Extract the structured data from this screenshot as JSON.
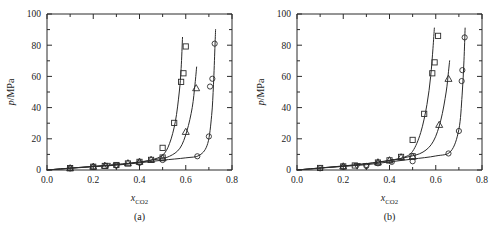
{
  "figure": {
    "panels": [
      {
        "id": "a",
        "caption": "(a)",
        "xlabel_main": "x",
        "xlabel_sub": "CO2",
        "ylabel_main": "p",
        "ylabel_rest": "/MPa"
      },
      {
        "id": "b",
        "caption": "(b)",
        "xlabel_main": "x",
        "xlabel_sub": "CO2",
        "ylabel_main": "p",
        "ylabel_rest": "/MPa"
      }
    ],
    "xticklabels": [
      "0.0",
      "0.2",
      "0.4",
      "0.6",
      "0.8"
    ],
    "yticklabels": [
      "0",
      "20",
      "40",
      "60",
      "80",
      "100"
    ],
    "colors": {
      "axis": "#2b2b2b",
      "curve": "#2b2b2b",
      "marker": "#2b2b2b",
      "background": "#ffffff"
    }
  },
  "chart_data": [
    {
      "type": "scatter",
      "panel": "(a)",
      "title": "",
      "xlabel": "x_CO2",
      "ylabel": "p/MPa",
      "xlim": [
        0.0,
        0.8
      ],
      "ylim": [
        0,
        100
      ],
      "xticks": [
        0.0,
        0.2,
        0.4,
        0.6,
        0.8
      ],
      "yticks": [
        0,
        20,
        40,
        60,
        80,
        100
      ],
      "xminorticks": [
        0.1,
        0.3,
        0.5,
        0.7
      ],
      "yminorticks": [
        10,
        30,
        50,
        70,
        90
      ],
      "grid": false,
      "legend": "none",
      "series": [
        {
          "name": "isotherm-1-square",
          "marker": "square",
          "points": [
            {
              "x": 0.1,
              "y": 1.2
            },
            {
              "x": 0.2,
              "y": 2.1
            },
            {
              "x": 0.25,
              "y": 2.6
            },
            {
              "x": 0.3,
              "y": 3.2
            },
            {
              "x": 0.35,
              "y": 4.2
            },
            {
              "x": 0.4,
              "y": 5.2
            },
            {
              "x": 0.45,
              "y": 6.5
            },
            {
              "x": 0.5,
              "y": 8.0
            },
            {
              "x": 0.5,
              "y": 14.2
            },
            {
              "x": 0.55,
              "y": 30.2
            },
            {
              "x": 0.58,
              "y": 56.5
            },
            {
              "x": 0.59,
              "y": 62.0
            },
            {
              "x": 0.6,
              "y": 79.2
            }
          ],
          "curve": [
            {
              "x": 0.0,
              "y": 0.0
            },
            {
              "x": 0.1,
              "y": 1.2
            },
            {
              "x": 0.2,
              "y": 2.3
            },
            {
              "x": 0.3,
              "y": 3.4
            },
            {
              "x": 0.4,
              "y": 5.0
            },
            {
              "x": 0.45,
              "y": 6.4
            },
            {
              "x": 0.5,
              "y": 9.5
            },
            {
              "x": 0.53,
              "y": 17.0
            },
            {
              "x": 0.555,
              "y": 31.0
            },
            {
              "x": 0.572,
              "y": 50.0
            },
            {
              "x": 0.58,
              "y": 65.0
            },
            {
              "x": 0.586,
              "y": 85.0
            }
          ]
        },
        {
          "name": "isotherm-2-triangle",
          "marker": "triangle-up",
          "points": [
            {
              "x": 0.1,
              "y": 1.2
            },
            {
              "x": 0.2,
              "y": 2.2
            },
            {
              "x": 0.25,
              "y": 2.8
            },
            {
              "x": 0.35,
              "y": 4.4
            },
            {
              "x": 0.4,
              "y": 5.4
            },
            {
              "x": 0.45,
              "y": 6.6
            },
            {
              "x": 0.5,
              "y": 7.6
            },
            {
              "x": 0.6,
              "y": 24.5
            },
            {
              "x": 0.645,
              "y": 52.5
            }
          ],
          "curve": [
            {
              "x": 0.0,
              "y": 0.0
            },
            {
              "x": 0.1,
              "y": 1.2
            },
            {
              "x": 0.2,
              "y": 2.3
            },
            {
              "x": 0.3,
              "y": 3.5
            },
            {
              "x": 0.4,
              "y": 5.2
            },
            {
              "x": 0.48,
              "y": 7.0
            },
            {
              "x": 0.53,
              "y": 8.8
            },
            {
              "x": 0.575,
              "y": 14.0
            },
            {
              "x": 0.605,
              "y": 25.0
            },
            {
              "x": 0.628,
              "y": 40.0
            },
            {
              "x": 0.64,
              "y": 55.0
            },
            {
              "x": 0.647,
              "y": 66.0
            }
          ]
        },
        {
          "name": "isotherm-3-circle",
          "marker": "circle",
          "points": [
            {
              "x": 0.1,
              "y": 1.0
            },
            {
              "x": 0.2,
              "y": 2.0
            },
            {
              "x": 0.3,
              "y": 2.9
            },
            {
              "x": 0.4,
              "y": 4.6
            },
            {
              "x": 0.5,
              "y": 6.4
            },
            {
              "x": 0.65,
              "y": 8.8
            },
            {
              "x": 0.7,
              "y": 21.5
            },
            {
              "x": 0.705,
              "y": 53.5
            },
            {
              "x": 0.715,
              "y": 58.5
            },
            {
              "x": 0.725,
              "y": 81.0
            }
          ],
          "curve": [
            {
              "x": 0.0,
              "y": 0.0
            },
            {
              "x": 0.1,
              "y": 1.1
            },
            {
              "x": 0.2,
              "y": 2.1
            },
            {
              "x": 0.3,
              "y": 3.1
            },
            {
              "x": 0.4,
              "y": 4.6
            },
            {
              "x": 0.5,
              "y": 6.3
            },
            {
              "x": 0.6,
              "y": 7.8
            },
            {
              "x": 0.66,
              "y": 9.5
            },
            {
              "x": 0.695,
              "y": 17.0
            },
            {
              "x": 0.712,
              "y": 35.0
            },
            {
              "x": 0.72,
              "y": 55.0
            },
            {
              "x": 0.726,
              "y": 78.0
            },
            {
              "x": 0.729,
              "y": 90.0
            }
          ]
        },
        {
          "name": "low-x-inverted-triangle",
          "marker": "triangle-down",
          "points": [
            {
              "x": 0.26,
              "y": 2.7
            },
            {
              "x": 0.3,
              "y": 2.8
            }
          ],
          "curve": []
        }
      ]
    },
    {
      "type": "scatter",
      "panel": "(b)",
      "title": "",
      "xlabel": "x_CO2",
      "ylabel": "p/MPa",
      "xlim": [
        0.0,
        0.8
      ],
      "ylim": [
        0,
        100
      ],
      "xticks": [
        0.0,
        0.2,
        0.4,
        0.6,
        0.8
      ],
      "yticks": [
        0,
        20,
        40,
        60,
        80,
        100
      ],
      "xminorticks": [
        0.1,
        0.3,
        0.5,
        0.7
      ],
      "yminorticks": [
        10,
        30,
        50,
        70,
        90
      ],
      "grid": false,
      "legend": "none",
      "series": [
        {
          "name": "isotherm-1-square",
          "marker": "square",
          "points": [
            {
              "x": 0.1,
              "y": 1.3
            },
            {
              "x": 0.2,
              "y": 2.3
            },
            {
              "x": 0.25,
              "y": 2.9
            },
            {
              "x": 0.35,
              "y": 4.8
            },
            {
              "x": 0.4,
              "y": 6.2
            },
            {
              "x": 0.45,
              "y": 8.4
            },
            {
              "x": 0.5,
              "y": 8.8
            },
            {
              "x": 0.5,
              "y": 19.3
            },
            {
              "x": 0.55,
              "y": 36.0
            },
            {
              "x": 0.585,
              "y": 62.0
            },
            {
              "x": 0.595,
              "y": 69.0
            },
            {
              "x": 0.61,
              "y": 86.0
            }
          ],
          "curve": [
            {
              "x": 0.0,
              "y": 0.0
            },
            {
              "x": 0.1,
              "y": 1.3
            },
            {
              "x": 0.2,
              "y": 2.5
            },
            {
              "x": 0.3,
              "y": 4.0
            },
            {
              "x": 0.4,
              "y": 6.0
            },
            {
              "x": 0.46,
              "y": 8.0
            },
            {
              "x": 0.5,
              "y": 12.0
            },
            {
              "x": 0.535,
              "y": 24.0
            },
            {
              "x": 0.562,
              "y": 42.0
            },
            {
              "x": 0.578,
              "y": 60.0
            },
            {
              "x": 0.588,
              "y": 78.0
            },
            {
              "x": 0.594,
              "y": 91.0
            }
          ]
        },
        {
          "name": "isotherm-2-triangle",
          "marker": "triangle-up",
          "points": [
            {
              "x": 0.2,
              "y": 2.4
            },
            {
              "x": 0.35,
              "y": 5.0
            },
            {
              "x": 0.4,
              "y": 6.3
            },
            {
              "x": 0.45,
              "y": 8.2
            },
            {
              "x": 0.5,
              "y": 8.6
            },
            {
              "x": 0.615,
              "y": 29.0
            },
            {
              "x": 0.655,
              "y": 58.5
            }
          ],
          "curve": [
            {
              "x": 0.0,
              "y": 0.0
            },
            {
              "x": 0.1,
              "y": 1.3
            },
            {
              "x": 0.2,
              "y": 2.6
            },
            {
              "x": 0.3,
              "y": 4.1
            },
            {
              "x": 0.4,
              "y": 6.2
            },
            {
              "x": 0.48,
              "y": 8.4
            },
            {
              "x": 0.545,
              "y": 11.5
            },
            {
              "x": 0.59,
              "y": 18.5
            },
            {
              "x": 0.622,
              "y": 32.0
            },
            {
              "x": 0.645,
              "y": 50.0
            },
            {
              "x": 0.655,
              "y": 63.0
            },
            {
              "x": 0.66,
              "y": 70.0
            }
          ]
        },
        {
          "name": "isotherm-3-circle",
          "marker": "circle",
          "points": [
            {
              "x": 0.1,
              "y": 1.1
            },
            {
              "x": 0.2,
              "y": 2.0
            },
            {
              "x": 0.3,
              "y": 2.6
            },
            {
              "x": 0.35,
              "y": 4.3
            },
            {
              "x": 0.41,
              "y": 5.2
            },
            {
              "x": 0.5,
              "y": 5.6
            },
            {
              "x": 0.655,
              "y": 10.6
            },
            {
              "x": 0.7,
              "y": 25.0
            },
            {
              "x": 0.712,
              "y": 57.0
            },
            {
              "x": 0.715,
              "y": 64.0
            },
            {
              "x": 0.725,
              "y": 85.0
            }
          ],
          "curve": [
            {
              "x": 0.0,
              "y": 0.0
            },
            {
              "x": 0.1,
              "y": 1.2
            },
            {
              "x": 0.2,
              "y": 2.3
            },
            {
              "x": 0.3,
              "y": 3.4
            },
            {
              "x": 0.4,
              "y": 5.2
            },
            {
              "x": 0.5,
              "y": 7.0
            },
            {
              "x": 0.6,
              "y": 9.0
            },
            {
              "x": 0.665,
              "y": 12.0
            },
            {
              "x": 0.7,
              "y": 26.0
            },
            {
              "x": 0.714,
              "y": 48.0
            },
            {
              "x": 0.722,
              "y": 70.0
            },
            {
              "x": 0.727,
              "y": 91.0
            }
          ]
        },
        {
          "name": "low-x-inverted-triangle",
          "marker": "triangle-down",
          "points": [
            {
              "x": 0.26,
              "y": 2.6
            },
            {
              "x": 0.3,
              "y": 2.5
            }
          ],
          "curve": []
        }
      ]
    }
  ]
}
